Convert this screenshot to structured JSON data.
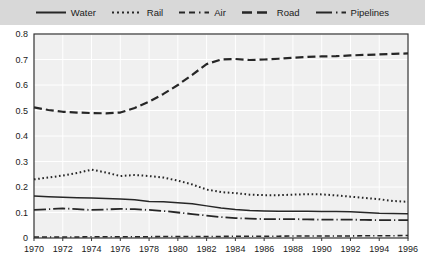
{
  "legend": {
    "items": [
      {
        "label": "Water",
        "style": "solid",
        "icon": "line-solid-icon"
      },
      {
        "label": "Rail",
        "style": "dotted",
        "icon": "line-dotted-icon"
      },
      {
        "label": "Air",
        "style": "dashdot",
        "icon": "line-dashdot-icon"
      },
      {
        "label": "Road",
        "style": "dashed",
        "icon": "line-dashed-icon"
      },
      {
        "label": "Pipelines",
        "style": "dashdot2",
        "icon": "line-dashdot2-icon"
      }
    ]
  },
  "colors": {
    "legend_background": "#d8d8d8",
    "plot_background": "#f0f0f0",
    "grid": "#ffffff",
    "axis": "#333333",
    "line": "#262626",
    "text": "#1a1a1a"
  },
  "chart_data": {
    "type": "line",
    "title": "",
    "subtitle": "",
    "xlabel": "",
    "ylabel": "",
    "xlim": [
      1970,
      1996
    ],
    "ylim": [
      0,
      0.8
    ],
    "grid": true,
    "legend_position": "top",
    "ytick_labels": [
      "0.8",
      "0.7",
      "0.6",
      "0.5",
      "0.4",
      "0.3",
      "0.2",
      "0.1",
      "0"
    ],
    "ytick_values": [
      0.8,
      0.7,
      0.6,
      0.5,
      0.4,
      0.3,
      0.2,
      0.1,
      0
    ],
    "xtick_labels": [
      "1970",
      "1972",
      "1974",
      "1976",
      "1978",
      "1980",
      "1982",
      "1984",
      "1986",
      "1988",
      "1990",
      "1992",
      "1994",
      "1996"
    ],
    "xtick_values": [
      1970,
      1972,
      1974,
      1976,
      1978,
      1980,
      1982,
      1984,
      1986,
      1988,
      1990,
      1992,
      1994,
      1996
    ],
    "x": [
      1970,
      1971,
      1972,
      1973,
      1974,
      1975,
      1976,
      1977,
      1978,
      1979,
      1980,
      1981,
      1982,
      1983,
      1984,
      1985,
      1986,
      1987,
      1988,
      1989,
      1990,
      1991,
      1992,
      1993,
      1994,
      1995,
      1996
    ],
    "series": [
      {
        "name": "Water",
        "style": "solid",
        "values": [
          0.165,
          0.162,
          0.16,
          0.158,
          0.157,
          0.155,
          0.153,
          0.15,
          0.143,
          0.142,
          0.138,
          0.134,
          0.126,
          0.118,
          0.112,
          0.108,
          0.106,
          0.105,
          0.105,
          0.105,
          0.104,
          0.104,
          0.103,
          0.1,
          0.097,
          0.096,
          0.095
        ]
      },
      {
        "name": "Rail",
        "style": "dotted",
        "values": [
          0.23,
          0.237,
          0.245,
          0.255,
          0.268,
          0.257,
          0.243,
          0.247,
          0.243,
          0.237,
          0.225,
          0.21,
          0.19,
          0.18,
          0.176,
          0.17,
          0.168,
          0.168,
          0.17,
          0.172,
          0.171,
          0.167,
          0.162,
          0.157,
          0.152,
          0.145,
          0.142
        ]
      },
      {
        "name": "Air",
        "style": "dashdot",
        "values": [
          0.004,
          0.004,
          0.004,
          0.004,
          0.005,
          0.005,
          0.005,
          0.005,
          0.005,
          0.006,
          0.006,
          0.006,
          0.006,
          0.006,
          0.007,
          0.007,
          0.007,
          0.007,
          0.008,
          0.008,
          0.008,
          0.008,
          0.008,
          0.009,
          0.009,
          0.009,
          0.01
        ]
      },
      {
        "name": "Road",
        "style": "dashed",
        "values": [
          0.512,
          0.502,
          0.495,
          0.492,
          0.49,
          0.489,
          0.492,
          0.51,
          0.535,
          0.565,
          0.6,
          0.64,
          0.682,
          0.7,
          0.702,
          0.698,
          0.7,
          0.703,
          0.707,
          0.71,
          0.712,
          0.713,
          0.716,
          0.718,
          0.72,
          0.722,
          0.724
        ]
      },
      {
        "name": "Pipelines",
        "style": "dashdot2",
        "values": [
          0.11,
          0.113,
          0.116,
          0.113,
          0.11,
          0.112,
          0.114,
          0.113,
          0.11,
          0.106,
          0.1,
          0.094,
          0.088,
          0.082,
          0.078,
          0.076,
          0.074,
          0.074,
          0.074,
          0.073,
          0.072,
          0.072,
          0.072,
          0.071,
          0.07,
          0.07,
          0.07
        ]
      }
    ]
  }
}
